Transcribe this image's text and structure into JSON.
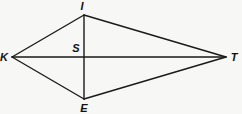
{
  "diagram": {
    "type": "kite",
    "points": {
      "I": {
        "x": 84,
        "y": 15
      },
      "E": {
        "x": 84,
        "y": 99
      },
      "K": {
        "x": 12,
        "y": 57
      },
      "T": {
        "x": 226,
        "y": 57
      },
      "S": {
        "x": 84,
        "y": 57
      }
    },
    "labels": {
      "I": "I",
      "E": "E",
      "K": "K",
      "T": "T",
      "S": "S"
    },
    "sides": [
      "KI",
      "IT",
      "TE",
      "EK"
    ],
    "diagonals": [
      "KT",
      "IE"
    ],
    "line_color": "#1a1a1a"
  }
}
